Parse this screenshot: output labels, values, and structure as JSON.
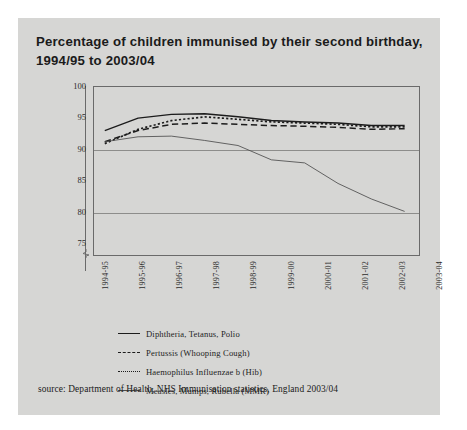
{
  "title": {
    "line1": "Percentage of children immunised by their second birthday,",
    "line2": "1994/95 to 2003/04"
  },
  "source": "source: Department of Health, NHS Immunisation statistics, England 2003/04",
  "chart_data": {
    "type": "line",
    "title": "Percentage of children immunised by their second birthday, 1994/95 to 2003/04",
    "xlabel": "",
    "ylabel": "",
    "ylim": [
      73,
      100
    ],
    "yticks": [
      100,
      95,
      90,
      85,
      80,
      75
    ],
    "gridlines": [
      90,
      80
    ],
    "grid": true,
    "axis_break": true,
    "legend_position": "below-plot",
    "categories": [
      "1994-95",
      "1995-96",
      "1996-97",
      "1997-98",
      "1998-99",
      "1999-00",
      "2000-01",
      "2001-02",
      "2002-03",
      "2003-04"
    ],
    "series": [
      {
        "name": "Diphtheria, Tetanus, Polio",
        "style": "solid",
        "color": "#1c1c1c",
        "values": [
          93.0,
          95.0,
          95.6,
          95.7,
          95.2,
          94.6,
          94.4,
          94.2,
          93.8,
          93.8
        ]
      },
      {
        "name": "Pertussis (Whooping Cough)",
        "style": "dashed",
        "color": "#1c1c1c",
        "values": [
          91.2,
          93.0,
          94.0,
          94.2,
          94.0,
          93.8,
          93.7,
          93.5,
          93.2,
          93.3
        ]
      },
      {
        "name": "Haemophilus Influenzae b (Hib)",
        "style": "dotted",
        "color": "#1c1c1c",
        "values": [
          90.9,
          93.2,
          94.6,
          95.2,
          94.8,
          94.4,
          94.2,
          94.0,
          93.6,
          93.6
        ]
      },
      {
        "name": "Measles, Mumps, Rubella (MMR)",
        "style": "thin-solid",
        "color": "#4d4d4d",
        "values": [
          91.2,
          92.0,
          92.1,
          91.4,
          90.6,
          88.3,
          87.8,
          84.5,
          82.0,
          80.0
        ]
      }
    ]
  },
  "legend": [
    {
      "label": "Diphtheria, Tetanus, Polio",
      "key": "solid"
    },
    {
      "label": "Pertussis (Whooping Cough)",
      "key": "dashed"
    },
    {
      "label": "Haemophilus Influenzae b (Hib)",
      "key": "dotted"
    },
    {
      "label": "Measles, Mumps, Rubella (MMR)",
      "key": "thin-solid"
    }
  ]
}
